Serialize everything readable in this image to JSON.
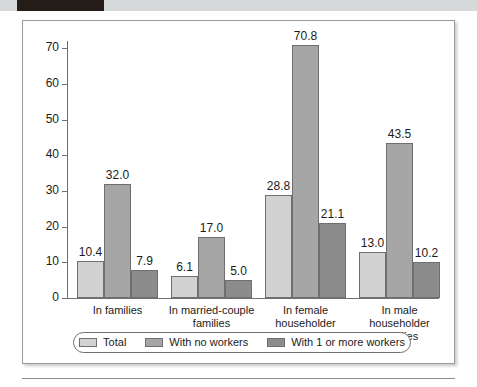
{
  "page_header": {
    "block_label": "",
    "strip_text": "",
    "block_color": "#241d17",
    "strip_color": "#d5d9da"
  },
  "chart_data": {
    "type": "bar",
    "title": "",
    "subtitle": "",
    "xlabel": "",
    "ylabel": "",
    "ylim": [
      0,
      72
    ],
    "yticks": [
      0,
      10,
      20,
      30,
      40,
      50,
      60,
      70
    ],
    "ytick_labels": [
      "0",
      "10",
      "20",
      "30",
      "40",
      "50",
      "60",
      "70"
    ],
    "grid": false,
    "legend_position": "bottom",
    "categories": [
      "In families",
      "In married-couple families",
      "In female householder families",
      "In male householder families"
    ],
    "category_lines": [
      [
        "In families"
      ],
      [
        "In married-couple",
        "families"
      ],
      [
        "In female",
        "householder",
        "families"
      ],
      [
        "In male",
        "householder",
        "families"
      ]
    ],
    "series": [
      {
        "name": "Total",
        "color": "#d2d2d2",
        "values": [
          10.4,
          6.1,
          28.8,
          13.0
        ],
        "labels": [
          "10.4",
          "6.1",
          "28.8",
          "13.0"
        ]
      },
      {
        "name": "With no workers",
        "color": "#a6a6a6",
        "values": [
          32.0,
          17.0,
          70.8,
          43.5
        ],
        "labels": [
          "32.0",
          "17.0",
          "70.8",
          "43.5"
        ]
      },
      {
        "name": "With 1 or more workers",
        "color": "#8c8c8c",
        "values": [
          7.9,
          5.0,
          21.1,
          10.2
        ],
        "labels": [
          "7.9",
          "5.0",
          "21.1",
          "10.2"
        ]
      }
    ]
  }
}
